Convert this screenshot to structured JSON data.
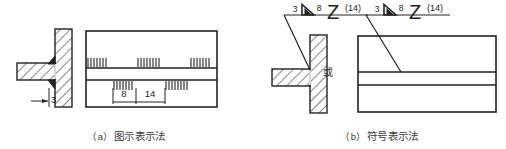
{
  "figure": {
    "title_visible": false,
    "width": 506,
    "height": 149,
    "ink_color": "#222222",
    "text_color": "#3a3a3a"
  },
  "panel_a": {
    "caption_index": "（a）",
    "caption_text": "图示表示法",
    "section_view": {
      "name": "t-joint-section",
      "weld_size_label": "3",
      "vertical_plate": "hatched-vertical-plate",
      "horizontal_plate": "hatched-horizontal-plate",
      "fillet_welds": 2
    },
    "plan_view": {
      "name": "intermittent-weld-plan",
      "upper_row_segments": 3,
      "lower_row_segments": 2,
      "dim_weld_length": "8",
      "dim_gap": "14"
    }
  },
  "panel_b": {
    "caption_index": "（b）",
    "caption_text": "符号表示法",
    "or_label": "或",
    "weld_symbol": {
      "name": "staggered-intermittent-fillet-weld-symbol",
      "throat_size": "3",
      "fillet_glyph": "▷",
      "segment_length": "8",
      "stagger_glyph": "Z",
      "pitch": "(14)"
    },
    "section_view": {
      "name": "t-joint-section-symbolic"
    },
    "plan_view": {
      "name": "plate-plan-symbolic"
    }
  }
}
